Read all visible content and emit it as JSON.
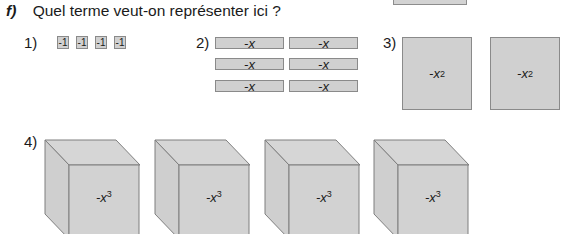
{
  "exercise": {
    "letter": "f)",
    "question": "Quel terme veut-on représenter ici ?"
  },
  "items": [
    {
      "label": "1)",
      "tiles": [
        "-1",
        "-1",
        "-1",
        "-1"
      ]
    },
    {
      "label": "2)",
      "tiles": [
        "-x",
        "-x",
        "-x",
        "-x",
        "-x",
        "-x"
      ]
    },
    {
      "label": "3)",
      "tiles": [
        {
          "base": "-x",
          "exp": "2"
        },
        {
          "base": "-x",
          "exp": "2"
        }
      ]
    },
    {
      "label": "4)",
      "tiles": [
        {
          "base": "-x",
          "exp": "3"
        },
        {
          "base": "-x",
          "exp": "3"
        },
        {
          "base": "-x",
          "exp": "3"
        },
        {
          "base": "-x",
          "exp": "3"
        }
      ]
    }
  ],
  "colors": {
    "tile_fill": "#d0d0d0",
    "tile_border": "#8a8a8a",
    "text": "#1a1a1a"
  }
}
